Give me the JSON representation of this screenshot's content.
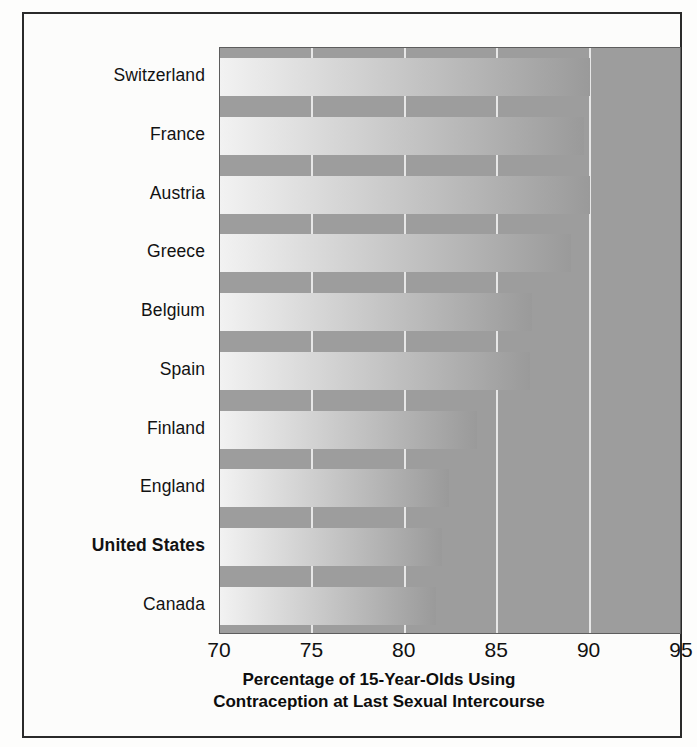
{
  "chart_data": {
    "type": "bar",
    "orientation": "horizontal",
    "title": "",
    "xlabel": "Percentage of 15-Year-Olds Using Contraception at Last Sexual Intercourse",
    "xlabel_line1": "Percentage of 15-Year-Olds Using",
    "xlabel_line2": "Contraception at Last Sexual Intercourse",
    "ylabel": "",
    "categories": [
      "Switzerland",
      "France",
      "Austria",
      "Greece",
      "Belgium",
      "Spain",
      "Finland",
      "England",
      "United States",
      "Canada"
    ],
    "values": [
      90.0,
      89.7,
      90.0,
      89.0,
      86.9,
      86.8,
      83.9,
      82.4,
      82.0,
      81.7
    ],
    "xlim": [
      70,
      95
    ],
    "xticks": [
      70,
      75,
      80,
      85,
      90,
      95
    ],
    "xtick_labels": [
      "70",
      "75",
      "80",
      "85",
      "90",
      "95"
    ],
    "grid": true,
    "grid_axis": "x",
    "legend": false,
    "highlighted_category": "United States",
    "bar_gradient_from": "#f2f2f2",
    "bar_gradient_to": "#9a9a9a",
    "plot_background": "#9d9d9d",
    "gridline_color": "#efefef",
    "frame_color": "#2a2a2a",
    "text_color": "#121212"
  }
}
